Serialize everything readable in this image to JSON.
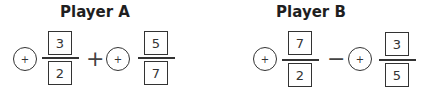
{
  "playerA": {
    "title": "Player A",
    "term1": {
      "sign": "+",
      "numerator": "3",
      "denominator": "2"
    },
    "operator": "+",
    "term2": {
      "sign": "+",
      "numerator": "5",
      "denominator": "7"
    }
  },
  "playerB": {
    "title": "Player B",
    "term1": {
      "sign": "+",
      "numerator": "7",
      "denominator": "2"
    },
    "operator": "−",
    "term2": {
      "sign": "+",
      "numerator": "3",
      "denominator": "5"
    }
  }
}
